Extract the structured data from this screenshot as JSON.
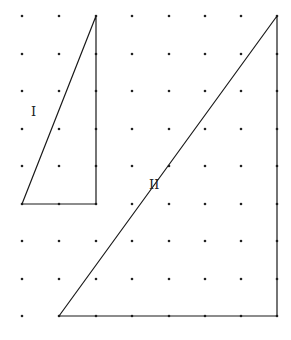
{
  "diagram": {
    "type": "dot-grid with two right triangles",
    "grid": {
      "columns_x": [
        22,
        59,
        96,
        132,
        169,
        205,
        241,
        277
      ],
      "rows_y": [
        16,
        54,
        91,
        129,
        166,
        204,
        241,
        279,
        316
      ],
      "dot_color": "#222222",
      "dot_radius": 1.3
    },
    "shapes": [
      {
        "id": "triangle-I",
        "label": "I",
        "vertices": [
          [
            96,
            16
          ],
          [
            96,
            204
          ],
          [
            22,
            204
          ]
        ],
        "label_pos": [
          31,
          105
        ]
      },
      {
        "id": "triangle-II",
        "label": "II",
        "vertices": [
          [
            277,
            16
          ],
          [
            277,
            316
          ],
          [
            59,
            316
          ]
        ],
        "label_pos": [
          149,
          178
        ]
      }
    ],
    "stroke_color": "#1a1a1a"
  }
}
